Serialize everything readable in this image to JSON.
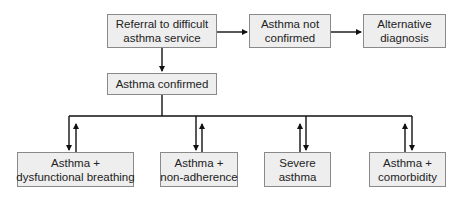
{
  "diagram": {
    "type": "flowchart",
    "nodes": {
      "referral": {
        "lines": [
          "Referral to difficult",
          "asthma service"
        ]
      },
      "not_confirmed": {
        "lines": [
          "Asthma not",
          "confirmed"
        ]
      },
      "alternative": {
        "lines": [
          "Alternative",
          "diagnosis"
        ]
      },
      "confirmed": {
        "lines": [
          "Asthma confirmed"
        ]
      },
      "dysfunctional": {
        "lines": [
          "Asthma +",
          "dysfunctional breathing"
        ]
      },
      "non_adherence": {
        "lines": [
          "Asthma +",
          "non-adherence"
        ]
      },
      "severe": {
        "lines": [
          "Severe",
          "asthma"
        ]
      },
      "comorbidity": {
        "lines": [
          "Asthma +",
          "comorbidity"
        ]
      }
    },
    "edges": [
      {
        "from": "referral",
        "to": "not_confirmed",
        "direction": "forward"
      },
      {
        "from": "not_confirmed",
        "to": "alternative",
        "direction": "forward"
      },
      {
        "from": "referral",
        "to": "confirmed",
        "direction": "forward"
      },
      {
        "from": "confirmed",
        "to": "dysfunctional",
        "direction": "bidirectional"
      },
      {
        "from": "confirmed",
        "to": "non_adherence",
        "direction": "bidirectional"
      },
      {
        "from": "confirmed",
        "to": "severe",
        "direction": "bidirectional"
      },
      {
        "from": "confirmed",
        "to": "comorbidity",
        "direction": "bidirectional"
      }
    ],
    "colors": {
      "box_fill": "#eeeeee",
      "box_border": "#8a8a8a",
      "line": "#111111",
      "text": "#222222"
    }
  }
}
